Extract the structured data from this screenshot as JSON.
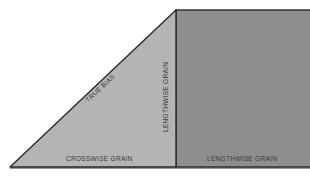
{
  "diagram": {
    "colors": {
      "background": "#ffffff",
      "triangle_fill": "#b4b4b4",
      "rectangle_fill": "#8e8e8e",
      "outline": "#2a2a2a",
      "label_text": "#3a3a3a"
    },
    "triangle": {
      "label_hypotenuse": "TRUE BIAS",
      "label_vertical": "LENGTHWISE GRAIN",
      "label_base": "CROSSWISE GRAIN"
    },
    "rectangle": {
      "label_base": "LENGTHWISE GRAIN"
    }
  }
}
